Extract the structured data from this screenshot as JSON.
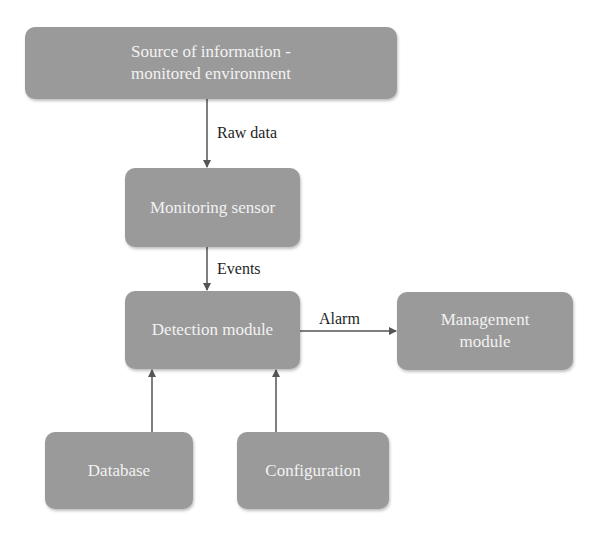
{
  "diagram": {
    "type": "flowchart",
    "colors": {
      "box_fill": "#9a9a9a",
      "box_text": "#f2f2f2",
      "arrow": "#555555",
      "label_text": "#1e1e1e"
    },
    "nodes": {
      "source": {
        "line1": "Source of information -",
        "line2": "monitored environment"
      },
      "sensor": {
        "label": "Monitoring sensor"
      },
      "detection": {
        "label": "Detection module"
      },
      "management": {
        "line1": "Management",
        "line2": "module"
      },
      "database": {
        "label": "Database"
      },
      "configuration": {
        "label": "Configuration"
      }
    },
    "edges": {
      "raw_data": {
        "from": "source",
        "to": "sensor",
        "label": "Raw data"
      },
      "events": {
        "from": "sensor",
        "to": "detection",
        "label": "Events"
      },
      "alarm": {
        "from": "detection",
        "to": "management",
        "label": "Alarm"
      },
      "db_to_detection": {
        "from": "database",
        "to": "detection",
        "label": ""
      },
      "config_to_detection": {
        "from": "configuration",
        "to": "detection",
        "label": ""
      }
    }
  }
}
